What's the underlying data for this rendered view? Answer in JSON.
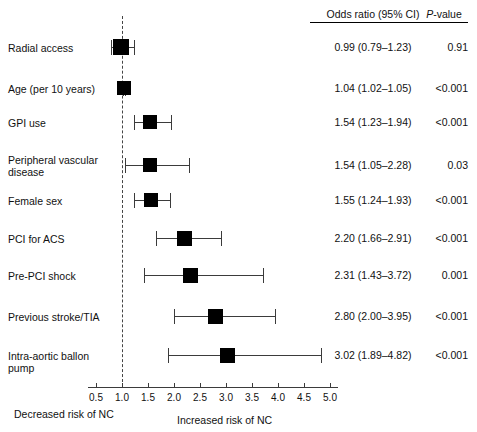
{
  "headers": {
    "or_label": "Odds ratio (95% CI)",
    "p_label_italic": "P",
    "p_label_rest": "-value"
  },
  "footer": {
    "left_caption": "Decreased risk of NC",
    "right_caption": "Increased risk of NC"
  },
  "colors": {
    "marker": "#000000",
    "ci_line": "#3b3b3b",
    "reference_line": "#444444",
    "text": "#111111",
    "background": "#ffffff"
  },
  "chart_data": {
    "type": "forest",
    "title": "",
    "xlabel": "Odds ratio",
    "ylabel": "",
    "xlim": [
      0.5,
      5.0
    ],
    "xscale": "linear",
    "grid": false,
    "reference_value": 1.0,
    "ticks": [
      "0.5",
      "1.0",
      "1.5",
      "2.0",
      "2.5",
      "3.0",
      "3.5",
      "4.0",
      "4.5",
      "5.0"
    ],
    "tick_values": [
      0.5,
      1.0,
      1.5,
      2.0,
      2.5,
      3.0,
      3.5,
      4.0,
      4.5,
      5.0
    ],
    "rows": [
      {
        "label": "Radial access",
        "or": 0.99,
        "lo": 0.79,
        "hi": 1.23,
        "or_text": "0.99 (0.79–1.23)",
        "p_text": "0.91"
      },
      {
        "label": "Age (per 10 years)",
        "or": 1.04,
        "lo": 1.02,
        "hi": 1.05,
        "or_text": "1.04 (1.02–1.05)",
        "p_text": "<0.001"
      },
      {
        "label": "GPI use",
        "or": 1.54,
        "lo": 1.23,
        "hi": 1.94,
        "or_text": "1.54 (1.23–1.94)",
        "p_text": "<0.001"
      },
      {
        "label": "Peripheral vascular disease",
        "or": 1.54,
        "lo": 1.05,
        "hi": 2.28,
        "or_text": "1.54 (1.05–2.28)",
        "p_text": "0.03"
      },
      {
        "label": "Female sex",
        "or": 1.55,
        "lo": 1.24,
        "hi": 1.93,
        "or_text": "1.55 (1.24–1.93)",
        "p_text": "<0.001"
      },
      {
        "label": "PCI for ACS",
        "or": 2.2,
        "lo": 1.66,
        "hi": 2.91,
        "or_text": "2.20 (1.66–2.91)",
        "p_text": "<0.001"
      },
      {
        "label": "Pre-PCI shock",
        "or": 2.31,
        "lo": 1.43,
        "hi": 3.72,
        "or_text": "2.31 (1.43–3.72)",
        "p_text": "0.001"
      },
      {
        "label": "Previous stroke/TIA",
        "or": 2.8,
        "lo": 2.0,
        "hi": 3.95,
        "or_text": "2.80 (2.00–3.95)",
        "p_text": "<0.001"
      },
      {
        "label": "Intra-aortic ballon pump",
        "or": 3.02,
        "lo": 1.89,
        "hi": 4.82,
        "or_text": "3.02 (1.89–4.82)",
        "p_text": "<0.001"
      }
    ]
  },
  "layout": {
    "axis_x_min_px": 96,
    "axis_x_max_px": 330,
    "axis_y_px": 387,
    "row_y_px": [
      47,
      88,
      122,
      165,
      200,
      238,
      275,
      316,
      355
    ],
    "label_y_px": [
      42,
      83,
      117,
      154,
      195,
      233,
      270,
      311,
      350
    ],
    "marker_size_px": [
      16,
      14,
      14,
      14,
      14,
      15,
      15,
      15,
      15
    ]
  }
}
